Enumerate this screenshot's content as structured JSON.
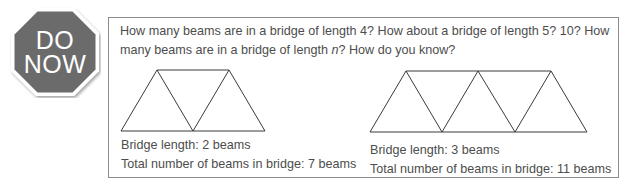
{
  "badge": {
    "line1": "DO",
    "line2": "NOW",
    "shape": "octagon-stop-sign",
    "fill_color": "#6b6b6b",
    "border_color": "#ffffff"
  },
  "prompt": {
    "part1": "How many beams are in a bridge of length 4? How about a bridge of length 5? 10? How many beams are in a bridge of length ",
    "variable": "n",
    "part2": "? How do you know?"
  },
  "bridges": [
    {
      "length_label": "Bridge length: 2 beams",
      "total_label": "Total number of beams in bridge: 7 beams",
      "length": 2,
      "total_beams": 7
    },
    {
      "length_label": "Bridge length: 3 beams",
      "total_label": "Total number of beams in bridge: 11 beams",
      "length": 3,
      "total_beams": 11
    }
  ]
}
